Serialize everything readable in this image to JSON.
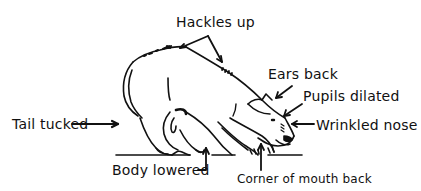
{
  "diagram": {
    "labels": {
      "hackles": "Hackles up",
      "ears": "Ears back",
      "pupils": "Pupils dilated",
      "nose": "Wrinkled nose",
      "tail": "Tail tucked",
      "body": "Body lowered",
      "mouth": "Corner of mouth back"
    },
    "colors": {
      "ink": "#111111",
      "background": "#ffffff"
    }
  }
}
